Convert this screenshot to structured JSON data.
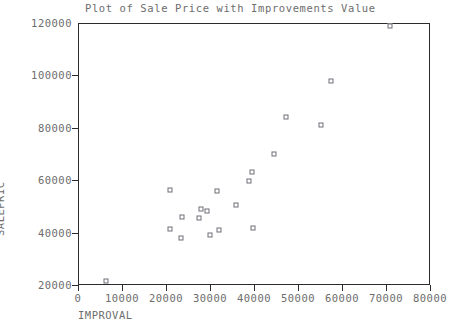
{
  "chart_data": {
    "type": "scatter",
    "title": "Plot of Sale Price with Improvements Value",
    "xlabel": "IMPROVAL",
    "ylabel": "SALEPRIC",
    "xlim": [
      0,
      80000
    ],
    "ylim": [
      20000,
      120000
    ],
    "grid": false,
    "legend": null,
    "marker": "open-square",
    "marker_color": "#6e6e78",
    "axis_color": "#2b2b2b",
    "text_color": "#6d6d6d",
    "background": "#ffffff",
    "xticks": [
      0,
      10000,
      20000,
      30000,
      40000,
      50000,
      60000,
      70000,
      80000
    ],
    "xtick_labels": [
      "0",
      "10000",
      "20000",
      "30000",
      "40000",
      "50000",
      "60000",
      "70000",
      "80000"
    ],
    "yticks": [
      20000,
      40000,
      60000,
      80000,
      100000,
      120000
    ],
    "ytick_labels": [
      "20000",
      "40000",
      "60000",
      "80000",
      "100000",
      "120000"
    ],
    "points": [
      {
        "x": 6400,
        "y": 21500
      },
      {
        "x": 21000,
        "y": 41500
      },
      {
        "x": 21000,
        "y": 56400
      },
      {
        "x": 23300,
        "y": 38000
      },
      {
        "x": 23600,
        "y": 45800
      },
      {
        "x": 27600,
        "y": 45700
      },
      {
        "x": 28000,
        "y": 49200
      },
      {
        "x": 29400,
        "y": 48300
      },
      {
        "x": 29900,
        "y": 38900
      },
      {
        "x": 31700,
        "y": 56000
      },
      {
        "x": 32000,
        "y": 40900
      },
      {
        "x": 36000,
        "y": 50600
      },
      {
        "x": 38900,
        "y": 59700
      },
      {
        "x": 39500,
        "y": 63100
      },
      {
        "x": 39700,
        "y": 41800
      },
      {
        "x": 44500,
        "y": 69900
      },
      {
        "x": 47200,
        "y": 84200
      },
      {
        "x": 55200,
        "y": 80900
      },
      {
        "x": 57500,
        "y": 97900
      },
      {
        "x": 71000,
        "y": 118700
      }
    ]
  }
}
